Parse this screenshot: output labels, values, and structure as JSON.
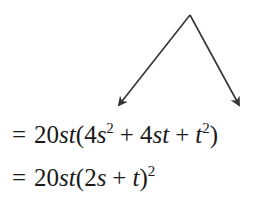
{
  "diagram": {
    "apex": {
      "x": 190,
      "y": 15
    },
    "left_tip": {
      "x": 117,
      "y": 107
    },
    "right_tip": {
      "x": 240,
      "y": 107
    },
    "stroke_color": "#333333"
  },
  "equations": [
    {
      "eq": "=",
      "coef": "20",
      "v1": "s",
      "v2": "t",
      "open": "(",
      "t1_coef": "4",
      "t1_var": "s",
      "t1_exp": "2",
      "plus1": "+",
      "t2_coef": "4",
      "t2_var1": "s",
      "t2_var2": "t",
      "plus2": "+",
      "t3_var": "t",
      "t3_exp": "2",
      "close": ")"
    },
    {
      "eq": "=",
      "coef": "20",
      "v1": "s",
      "v2": "t",
      "open": "(",
      "t1_coef": "2",
      "t1_var": "s",
      "plus1": "+",
      "t2_var": "t",
      "close": ")",
      "exp": "2"
    }
  ]
}
